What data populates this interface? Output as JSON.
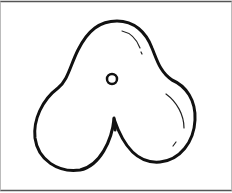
{
  "figure": {
    "colors": {
      "stroke": "#111111",
      "frame": "#555555",
      "background": "#ffffff"
    }
  }
}
